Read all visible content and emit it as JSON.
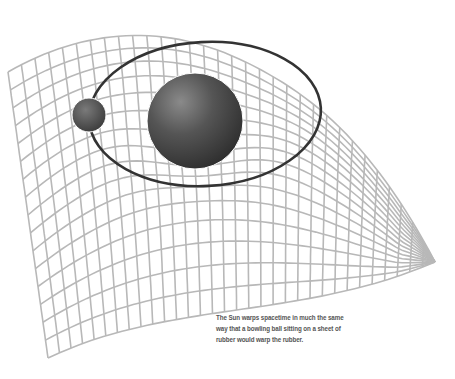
{
  "figure": {
    "caption_lines": [
      "The Sun warps spacetime in much the same",
      "way that a bowling ball sitting on a sheet of",
      "rubber would warp the rubber."
    ],
    "elements": {
      "grid": {
        "label": "spacetime-grid",
        "color": "#b8b8b8"
      },
      "sun": {
        "label": "sun",
        "color": "#4a4a4a"
      },
      "planet": {
        "label": "planet",
        "color": "#4a4a4a"
      },
      "orbit": {
        "label": "orbit",
        "color": "#333333"
      }
    }
  }
}
